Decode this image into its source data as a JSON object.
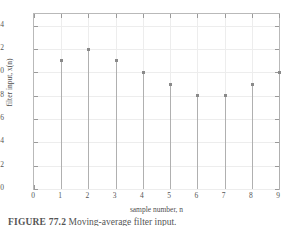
{
  "figure": {
    "caption_label": "FIGURE 77.2",
    "caption_text": "Moving-average filter input.",
    "background_color": "#ffffff",
    "frame_color": "#b9b9b9",
    "grid_color": "#ededed",
    "marker_color": "#8a8a8a",
    "stem_color": "#b0b0b0"
  },
  "chart_data": {
    "type": "scatter",
    "plot_style": "stem",
    "title": "",
    "xlabel": "sample number, n",
    "ylabel": "filter input, x(n)",
    "x": [
      1,
      2,
      3,
      4,
      5,
      6,
      7,
      8,
      9
    ],
    "values": [
      11,
      12,
      11,
      10,
      9,
      8,
      8,
      9,
      10
    ],
    "points": [
      {
        "n": 1,
        "x(n)": 11
      },
      {
        "n": 2,
        "x(n)": 12
      },
      {
        "n": 3,
        "x(n)": 11
      },
      {
        "n": 4,
        "x(n)": 10
      },
      {
        "n": 5,
        "x(n)": 9
      },
      {
        "n": 6,
        "x(n)": 8
      },
      {
        "n": 7,
        "x(n)": 8
      },
      {
        "n": 8,
        "x(n)": 9
      },
      {
        "n": 9,
        "x(n)": 10
      }
    ],
    "xlim": [
      0,
      9
    ],
    "ylim": [
      0,
      15
    ],
    "xticks": [
      0,
      1,
      2,
      3,
      4,
      5,
      6,
      7,
      8,
      9
    ],
    "yticks": [
      0,
      2,
      4,
      6,
      8,
      10,
      12,
      14
    ],
    "xticklabels": [
      "0",
      "1",
      "2",
      "3",
      "4",
      "5",
      "6",
      "7",
      "8",
      "9"
    ],
    "yticklabels": [
      "0",
      "2",
      "4",
      "6",
      "8",
      "10",
      "12",
      "14"
    ],
    "grid": true,
    "legend": null,
    "legend_position": "none",
    "baseline": 0
  }
}
